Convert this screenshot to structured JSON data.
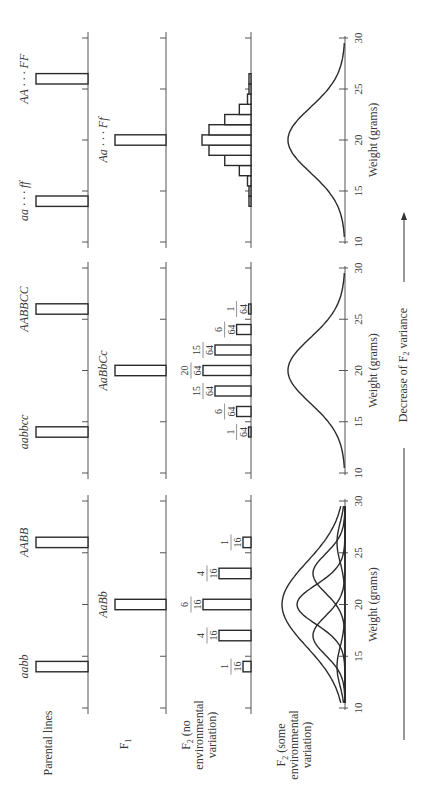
{
  "figure": {
    "orientation": "rotated 90 degrees counter-clockwise",
    "row_labels": {
      "parental": "Parental lines",
      "f1": "F",
      "f1_sub": "1",
      "f2_no_env": [
        "F",
        "2",
        " (no",
        "environmental",
        "variation)"
      ],
      "f2_some_env": [
        "F",
        "2",
        " (some",
        "environmental",
        "variation)"
      ]
    },
    "axis_label": "Weight (grams)",
    "ticks": [
      "10",
      "15",
      "20",
      "25",
      "30"
    ],
    "bottom_note": "Decrease of F",
    "bottom_note_sub": "2",
    "bottom_note_tail": " variance"
  },
  "chart_data": [
    {
      "type": "bar",
      "panel": "two gene pairs",
      "xlabel": "Weight (grams)",
      "xlim": [
        10,
        30
      ],
      "parental": [
        {
          "genotype": "aabb",
          "weight": 14
        },
        {
          "genotype": "AABB",
          "weight": 26
        }
      ],
      "f1": [
        {
          "genotype": "AaBb",
          "weight": 20
        }
      ],
      "f2": {
        "weights": [
          14,
          17,
          20,
          23,
          26
        ],
        "fractions": [
          "1/16",
          "4/16",
          "6/16",
          "4/16",
          "1/16"
        ],
        "numerators": [
          1,
          4,
          6,
          4,
          1
        ],
        "denominator": 16
      },
      "f2_env": {
        "type": "overlapping normal curves",
        "peaks": [
          14,
          17,
          20,
          23,
          26
        ],
        "envelope_peak": 20
      }
    },
    {
      "type": "bar",
      "panel": "three gene pairs",
      "xlabel": "Weight (grams)",
      "xlim": [
        10,
        30
      ],
      "parental": [
        {
          "genotype": "aabbcc",
          "weight": 14
        },
        {
          "genotype": "AABBCC",
          "weight": 26
        }
      ],
      "f1": [
        {
          "genotype": "AaBbCc",
          "weight": 20
        }
      ],
      "f2": {
        "weights": [
          14,
          16,
          18,
          20,
          22,
          24,
          26
        ],
        "fractions": [
          "1/64",
          "6/64",
          "15/64",
          "20/64",
          "15/64",
          "6/64",
          "1/64"
        ],
        "numerators": [
          1,
          6,
          15,
          20,
          15,
          6,
          1
        ],
        "denominator": 64
      },
      "f2_env": {
        "type": "normal curve",
        "peak": 20
      }
    },
    {
      "type": "bar",
      "panel": "six gene pairs",
      "xlabel": "Weight (grams)",
      "xlim": [
        10,
        30
      ],
      "parental": [
        {
          "genotype": "aa · · · ff",
          "weight": 14
        },
        {
          "genotype": "AA · · · FF",
          "weight": 26
        }
      ],
      "f1": [
        {
          "genotype": "Aa · · · Ff",
          "weight": 20
        }
      ],
      "f2": {
        "weights": [
          14,
          15,
          16,
          17,
          18,
          19,
          20,
          21,
          22,
          23,
          24,
          25,
          26
        ],
        "numerators": [
          1,
          12,
          66,
          220,
          495,
          792,
          924,
          792,
          495,
          220,
          66,
          12,
          1
        ],
        "denominator": 4096
      },
      "f2_env": {
        "type": "normal curve",
        "peak": 20
      }
    }
  ]
}
